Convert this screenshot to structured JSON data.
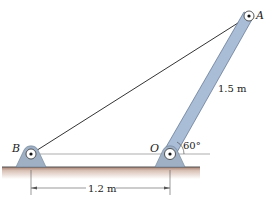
{
  "diagram": {
    "points": {
      "A": "A",
      "B": "B",
      "O": "O"
    },
    "labels": {
      "bar_length": "1.5 m",
      "angle": "60°",
      "base_distance": "1.2 m"
    },
    "colors": {
      "member_fill": "#a9bdd6",
      "member_stroke": "#5a6f8c",
      "support_fill": "#9fb0c4",
      "ground_top": "#a57f6e",
      "ground_fade": "#f4ebe6",
      "line": "#333333"
    }
  }
}
